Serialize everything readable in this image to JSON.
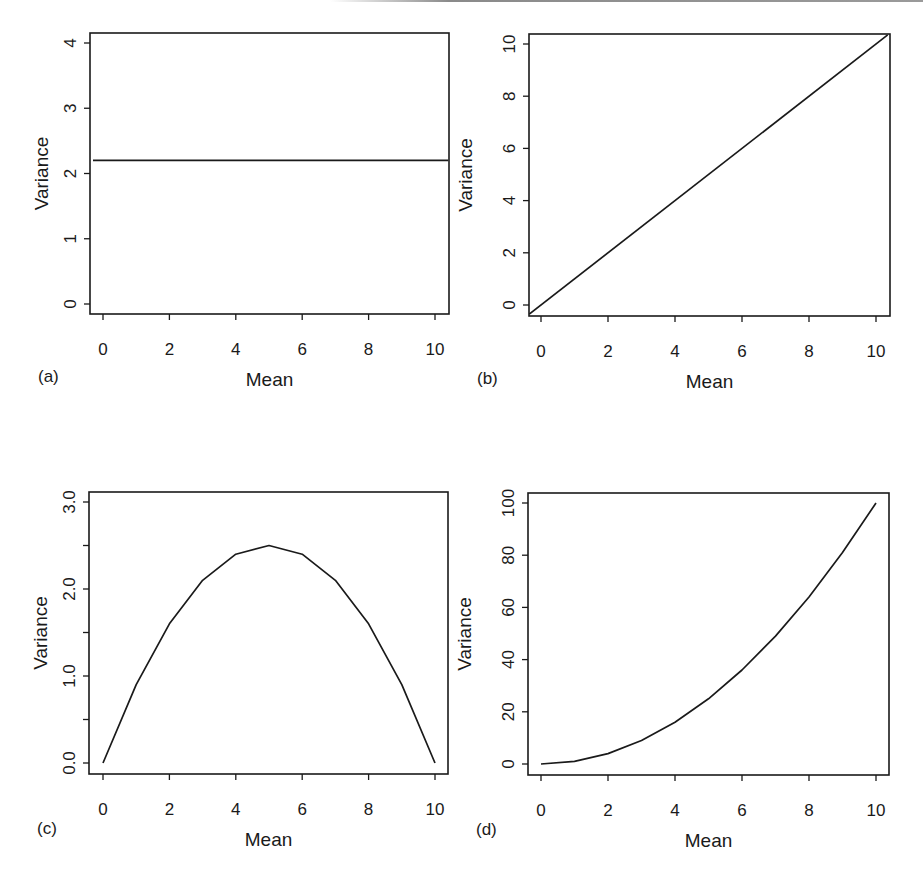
{
  "figure": {
    "panels_layout": "2x2",
    "line_color": "#1a1a1a",
    "background": "#ffffff"
  },
  "chart_data": [
    {
      "id": "a",
      "panel_label": "(a)",
      "type": "line",
      "title": "",
      "xlabel": "Mean",
      "ylabel": "Variance",
      "xlim": [
        -0.3,
        10.4
      ],
      "ylim": [
        -0.15,
        4.15
      ],
      "xticks": [
        0,
        2,
        4,
        6,
        8,
        10
      ],
      "xtick_labels": [
        "0",
        "2",
        "4",
        "6",
        "8",
        "10"
      ],
      "yticks": [
        0,
        1,
        2,
        3,
        4
      ],
      "ytick_labels": [
        "0",
        "1",
        "2",
        "3",
        "4"
      ],
      "grid": false,
      "legend": null,
      "description": "Constant variance",
      "series": [
        {
          "name": "variance",
          "x": [
            -0.3,
            10.4
          ],
          "y": [
            2.2,
            2.2
          ]
        }
      ],
      "box": {
        "left": 90,
        "top": 33,
        "right": 449,
        "bottom": 314
      },
      "px": {
        "x0": 103,
        "x1": 435,
        "xv0": 0,
        "xv1": 10,
        "y0": 304,
        "y1": 43,
        "yv0": 0,
        "yv1": 4
      }
    },
    {
      "id": "b",
      "panel_label": "(b)",
      "type": "line",
      "title": "",
      "xlabel": "Mean",
      "ylabel": "Variance",
      "xlim": [
        -0.35,
        10.35
      ],
      "ylim": [
        -0.35,
        10.35
      ],
      "xticks": [
        0,
        2,
        4,
        6,
        8,
        10
      ],
      "xtick_labels": [
        "0",
        "2",
        "4",
        "6",
        "8",
        "10"
      ],
      "yticks": [
        0,
        2,
        4,
        6,
        8,
        10
      ],
      "ytick_labels": [
        "0",
        "2",
        "4",
        "6",
        "8",
        "10"
      ],
      "grid": false,
      "legend": null,
      "description": "Variance proportional to mean (variance = mean)",
      "series": [
        {
          "name": "variance",
          "x": [
            -0.35,
            10.35
          ],
          "y": [
            -0.35,
            10.35
          ]
        }
      ],
      "box": {
        "left": 529,
        "top": 34,
        "right": 890,
        "bottom": 316
      },
      "px": {
        "x0": 541,
        "x1": 876,
        "xv0": 0,
        "xv1": 10,
        "y0": 305,
        "y1": 44,
        "yv0": 0,
        "yv1": 10
      }
    },
    {
      "id": "c",
      "panel_label": "(c)",
      "type": "line",
      "title": "",
      "xlabel": "Mean",
      "ylabel": "Variance",
      "xlim": [
        -0.4,
        10.4
      ],
      "ylim": [
        -0.12,
        3.12
      ],
      "xticks": [
        0,
        2,
        4,
        6,
        8,
        10
      ],
      "xtick_labels": [
        "0",
        "2",
        "4",
        "6",
        "8",
        "10"
      ],
      "yticks": [
        0.0,
        0.5,
        1.0,
        1.5,
        2.0,
        2.5,
        3.0
      ],
      "ytick_labels": [
        "0.0",
        "",
        "1.0",
        "",
        "2.0",
        "",
        "3.0"
      ],
      "grid": false,
      "legend": null,
      "description": "Binomial-type variance: mean*(1 - mean/10)",
      "series": [
        {
          "name": "variance",
          "x": [
            0,
            1,
            2,
            3,
            4,
            5,
            6,
            7,
            8,
            9,
            10
          ],
          "y": [
            0.0,
            0.9,
            1.6,
            2.1,
            2.4,
            2.5,
            2.4,
            2.1,
            1.6,
            0.9,
            0.0
          ]
        }
      ],
      "box": {
        "left": 89,
        "top": 492,
        "right": 448,
        "bottom": 774
      },
      "px": {
        "x0": 103,
        "x1": 435,
        "xv0": 0,
        "xv1": 10,
        "y0": 763,
        "y1": 502,
        "yv0": 0,
        "yv1": 3
      }
    },
    {
      "id": "d",
      "panel_label": "(d)",
      "type": "line",
      "title": "",
      "xlabel": "Mean",
      "ylabel": "Variance",
      "xlim": [
        -0.4,
        10.4
      ],
      "ylim": [
        -4,
        104
      ],
      "xticks": [
        0,
        2,
        4,
        6,
        8,
        10
      ],
      "xtick_labels": [
        "0",
        "2",
        "4",
        "6",
        "8",
        "10"
      ],
      "yticks": [
        0,
        20,
        40,
        60,
        80,
        100
      ],
      "ytick_labels": [
        "0",
        "20",
        "40",
        "60",
        "80",
        "100"
      ],
      "grid": false,
      "legend": null,
      "description": "Variance proportional to mean squared",
      "series": [
        {
          "name": "variance",
          "x": [
            0,
            1,
            2,
            3,
            4,
            5,
            6,
            7,
            8,
            9,
            10
          ],
          "y": [
            0,
            1,
            4,
            9,
            16,
            25,
            36,
            49,
            64,
            81,
            100
          ]
        }
      ],
      "box": {
        "left": 528,
        "top": 493,
        "right": 889,
        "bottom": 775
      },
      "px": {
        "x0": 541,
        "x1": 876,
        "xv0": 0,
        "xv1": 10,
        "y0": 764,
        "y1": 503,
        "yv0": 0,
        "yv1": 100
      }
    }
  ]
}
